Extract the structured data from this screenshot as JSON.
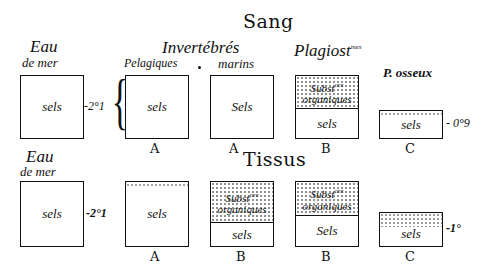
{
  "titles": {
    "blood": "Sang",
    "tissue": "Tissus"
  },
  "blood_row": {
    "sea_water": {
      "heading_line1": "Eau",
      "heading_line2": "de mer",
      "content": "sels",
      "value": "-2°1"
    },
    "invertebrates_heading": "Invertébrés",
    "pelagic": {
      "heading": "Pelagiques",
      "content": "sels",
      "letter": "A"
    },
    "marine": {
      "heading": "marins",
      "content": "Sels",
      "letter": "A"
    },
    "plagiostomes": {
      "heading": "Plagiost",
      "heading_sup": "mes",
      "organic_line1": "Subst",
      "organic_sup": "ces",
      "organic_line2": "organiques",
      "content": "sels",
      "letter": "B"
    },
    "bony_fish": {
      "heading": "P. osseux",
      "content": "sels",
      "value": "- 0°9",
      "letter": "C"
    }
  },
  "tissue_row": {
    "sea_water": {
      "heading_line1": "Eau",
      "heading_line2": "de mer",
      "content": "sels",
      "value": "-2°1"
    },
    "col_a": {
      "content": "sels",
      "letter": "A"
    },
    "col_b1": {
      "organic_line1": "Subst",
      "organic_sup": "ces",
      "organic_line2": "organiques",
      "content": "sels",
      "letter": "B"
    },
    "col_b2": {
      "organic_line1": "Subst",
      "organic_sup": "ces",
      "organic_line2": "organiques",
      "content": "Sels",
      "letter": "B"
    },
    "col_c": {
      "content": "sels",
      "value": "-1°",
      "letter": "C"
    }
  }
}
